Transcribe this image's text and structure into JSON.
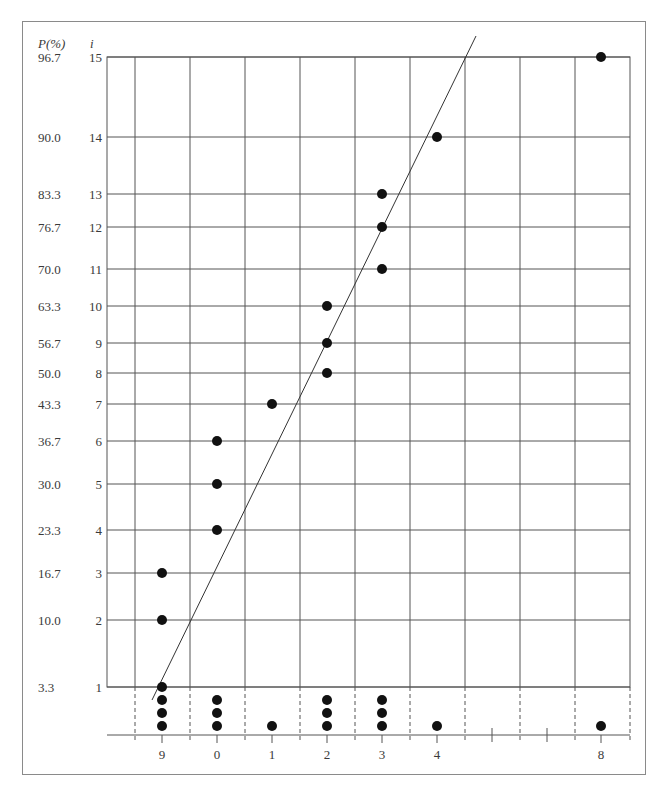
{
  "chart_data": {
    "type": "scatter",
    "title": "",
    "subtitle": "Normal probability plot with dot plot of data below",
    "ylabel_left": "P(%)",
    "ylabel_right": "i",
    "xlabel": "",
    "rows": [
      {
        "i": 1,
        "p": "3.3",
        "y": 687
      },
      {
        "i": 2,
        "p": "10.0",
        "y": 620
      },
      {
        "i": 3,
        "p": "16.7",
        "y": 573
      },
      {
        "i": 4,
        "p": "23.3",
        "y": 530
      },
      {
        "i": 5,
        "p": "30.0",
        "y": 484
      },
      {
        "i": 6,
        "p": "36.7",
        "y": 441
      },
      {
        "i": 7,
        "p": "43.3",
        "y": 404
      },
      {
        "i": 8,
        "p": "50.0",
        "y": 373
      },
      {
        "i": 9,
        "p": "56.7",
        "y": 343
      },
      {
        "i": 10,
        "p": "63.3",
        "y": 306
      },
      {
        "i": 11,
        "p": "70.0",
        "y": 269
      },
      {
        "i": 12,
        "p": "76.7",
        "y": 227
      },
      {
        "i": 13,
        "p": "83.3",
        "y": 194
      },
      {
        "i": 14,
        "p": "90.0",
        "y": 137
      },
      {
        "i": 15,
        "p": "96.7",
        "y": 57
      }
    ],
    "x_tick_labels": [
      {
        "label": "9",
        "x": 162
      },
      {
        "label": "0",
        "x": 217
      },
      {
        "label": "1",
        "x": 272
      },
      {
        "label": "2",
        "x": 327
      },
      {
        "label": "3",
        "x": 382
      },
      {
        "label": "4",
        "x": 437
      },
      {
        "label": "8",
        "x": 601
      }
    ],
    "points": [
      {
        "i": 1,
        "value": "9"
      },
      {
        "i": 2,
        "value": "9"
      },
      {
        "i": 3,
        "value": "9"
      },
      {
        "i": 4,
        "value": "0"
      },
      {
        "i": 5,
        "value": "0"
      },
      {
        "i": 6,
        "value": "0"
      },
      {
        "i": 7,
        "value": "1"
      },
      {
        "i": 8,
        "value": "2"
      },
      {
        "i": 9,
        "value": "2"
      },
      {
        "i": 10,
        "value": "2"
      },
      {
        "i": 11,
        "value": "3"
      },
      {
        "i": 12,
        "value": "3"
      },
      {
        "i": 13,
        "value": "3"
      },
      {
        "i": 14,
        "value": "4"
      },
      {
        "i": 15,
        "value": "8"
      }
    ],
    "dot_plot": [
      {
        "value": "9",
        "count": 4
      },
      {
        "value": "0",
        "count": 3
      },
      {
        "value": "1",
        "count": 1
      },
      {
        "value": "2",
        "count": 3
      },
      {
        "value": "3",
        "count": 3
      },
      {
        "value": "4",
        "count": 1
      },
      {
        "value": "8",
        "count": 1
      }
    ],
    "fit_line": {
      "x1": 152,
      "y1": 700,
      "x2": 476,
      "y2": 36
    },
    "axis_break_ticks_x": [
      492,
      547
    ],
    "grid": true,
    "legend": null
  },
  "layout": {
    "grid_left": 107,
    "grid_right": 630,
    "grid_top": 57,
    "grid_bottom": 687,
    "grid_columns_x": [
      135,
      190,
      245,
      300,
      355,
      410,
      465,
      520,
      575
    ],
    "baseline_y": 735,
    "dot_rows_y": [
      726,
      713,
      700,
      687
    ],
    "dot_radius": 5,
    "colors": {
      "grid": "#555555",
      "dots": "#111111",
      "frame": "#8a8a8a",
      "text": "#3a3a3a"
    }
  }
}
